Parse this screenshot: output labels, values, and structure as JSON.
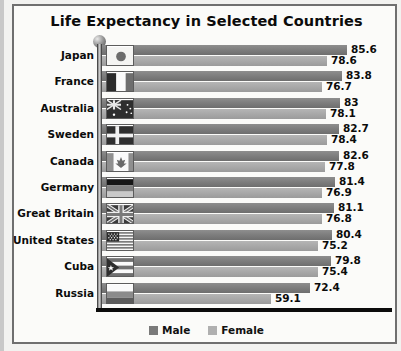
{
  "chart_data": {
    "type": "bar",
    "title": "Life Expectancy in Selected Countries",
    "orientation": "horizontal",
    "xlabel": "",
    "ylabel": "",
    "grid": false,
    "legend_position": "bottom-center",
    "categories": [
      "Japan",
      "France",
      "Australia",
      "Sweden",
      "Canada",
      "Germany",
      "Great Britain",
      "United States",
      "Cuba",
      "Russia"
    ],
    "series": [
      {
        "name": "Male",
        "color": "#7a7a7a",
        "values": [
          85.6,
          83.8,
          83,
          82.7,
          82.6,
          81.4,
          81.1,
          80.4,
          79.8,
          72.4
        ],
        "labels": [
          "85.6",
          "83.8",
          "83",
          "82.7",
          "82.6",
          "81.4",
          "81.1",
          "80.4",
          "79.8",
          "72.4"
        ]
      },
      {
        "name": "Female",
        "color": "#b0b0b0",
        "values": [
          78.6,
          76.7,
          78.1,
          78.4,
          77.8,
          76.9,
          76.8,
          75.2,
          75.4,
          59.1
        ],
        "labels": [
          "78.6",
          "76.7",
          "78.1",
          "78.4",
          "77.8",
          "76.9",
          "76.8",
          "75.2",
          "75.4",
          "59.1"
        ]
      }
    ],
    "xlim": [
      0,
      90
    ]
  },
  "chart": {
    "title": "Life Expectancy in Selected Countries",
    "rows": [
      {
        "country": "Japan",
        "flag": "flag-japan",
        "male": "85.6",
        "female": "78.6"
      },
      {
        "country": "France",
        "flag": "flag-france",
        "male": "83.8",
        "female": "76.7"
      },
      {
        "country": "Australia",
        "flag": "flag-australia",
        "male": "83",
        "female": "78.1"
      },
      {
        "country": "Sweden",
        "flag": "flag-sweden",
        "male": "82.7",
        "female": "78.4"
      },
      {
        "country": "Canada",
        "flag": "flag-canada",
        "male": "82.6",
        "female": "77.8"
      },
      {
        "country": "Germany",
        "flag": "flag-germany",
        "male": "81.4",
        "female": "76.9"
      },
      {
        "country": "Great Britain",
        "flag": "flag-great-britain",
        "male": "81.1",
        "female": "76.8"
      },
      {
        "country": "United States",
        "flag": "flag-united-states",
        "male": "80.4",
        "female": "75.2"
      },
      {
        "country": "Cuba",
        "flag": "flag-cuba",
        "male": "79.8",
        "female": "75.4"
      },
      {
        "country": "Russia",
        "flag": "flag-russia",
        "male": "72.4",
        "female": "59.1"
      }
    ],
    "legend": {
      "male_label": "Male",
      "female_label": "Female",
      "male_color": "#7a7a7a",
      "female_color": "#b0b0b0"
    }
  }
}
